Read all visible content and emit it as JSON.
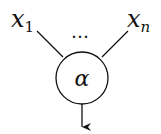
{
  "diagram": {
    "type": "neuron-node",
    "inputs": [
      {
        "label": "x",
        "subscript": "1"
      },
      {
        "label": "x",
        "subscript": "n"
      }
    ],
    "ellipsis": "…",
    "node_label": "α",
    "output": "arrow-down",
    "colors": {
      "stroke": "#111111",
      "background": "#ffffff"
    }
  }
}
